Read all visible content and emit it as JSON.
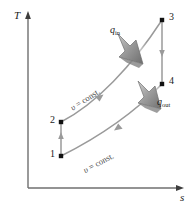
{
  "figure": {
    "type": "T-s diagram",
    "axes": {
      "y_label": "T",
      "x_label": "s",
      "origin": [
        28,
        188
      ],
      "y_top": [
        28,
        14
      ],
      "x_right": [
        184,
        188
      ]
    },
    "colors": {
      "axis": "#6f6f6f",
      "curve": "#8c8c8c",
      "point": "#111111",
      "block_arrow": "#9a9a9a",
      "block_arrow_dark": "#6d6d6d",
      "text": "#1a1a1a"
    },
    "states": [
      {
        "id": "1",
        "label": "1",
        "x": 61,
        "y": 156,
        "label_x": 50,
        "label_y": 150
      },
      {
        "id": "2",
        "label": "2",
        "x": 61,
        "y": 122,
        "label_x": 50,
        "label_y": 116
      },
      {
        "id": "3",
        "label": "3",
        "x": 162,
        "y": 20,
        "label_x": 169,
        "label_y": 13
      },
      {
        "id": "4",
        "label": "4",
        "x": 162,
        "y": 84,
        "label_x": 169,
        "label_y": 78
      }
    ],
    "processes": [
      {
        "name": "compression-1-2",
        "from": "1",
        "to": "2",
        "kind": "vertical",
        "arrow_direction": "up"
      },
      {
        "name": "heat-addition-2-3",
        "from": "2",
        "to": "3",
        "kind": "curve",
        "arrow_direction": "up-right",
        "label": "v = const."
      },
      {
        "name": "expansion-3-4",
        "from": "3",
        "to": "4",
        "kind": "vertical",
        "arrow_direction": "down"
      },
      {
        "name": "heat-rejection-4-1",
        "from": "4",
        "to": "1",
        "kind": "curve",
        "arrow_direction": "down-left",
        "label": "v = const."
      }
    ],
    "heat_labels": [
      {
        "name": "q-in",
        "symbol": "q",
        "subscript": "in",
        "x": 112,
        "y": 26
      },
      {
        "name": "q-out",
        "symbol": "q",
        "subscript": "out",
        "x": 158,
        "y": 98
      }
    ],
    "const_labels": [
      {
        "name": "v-const-upper",
        "symbol": "υ",
        "text": " = const.",
        "x": 73,
        "y": 104,
        "rotation": -33
      },
      {
        "name": "v-const-lower",
        "symbol": "υ",
        "text": " = const.",
        "x": 85,
        "y": 166,
        "rotation": -28
      }
    ]
  }
}
